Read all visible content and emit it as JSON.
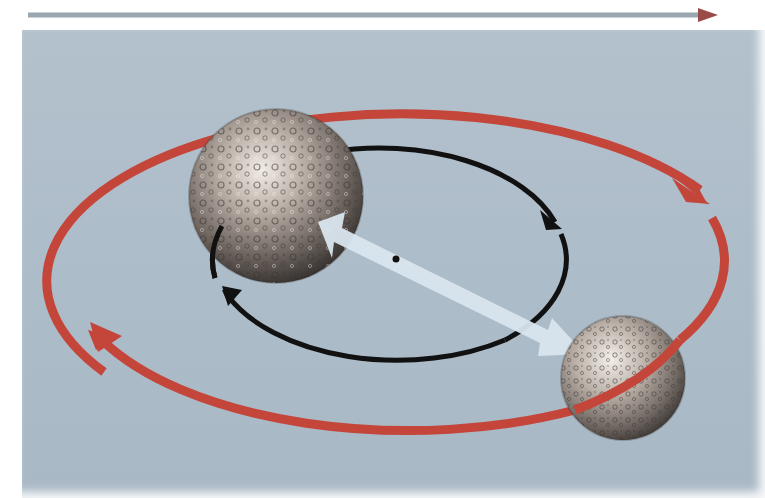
{
  "diagram": {
    "type": "binary-orbit-illustration",
    "colors": {
      "background_panel": "#adbcc8",
      "page_background": "#ffffff",
      "outer_orbit": "#c4463a",
      "inner_orbit": "#111111",
      "connector_arrow": "#d9e5ee",
      "dashed_arrow_dash": "#c0504d",
      "dashed_arrow_gap": "#9aa7b1",
      "barycenter_dot": "#111111"
    },
    "elements": {
      "top_arrow": {
        "style": "dashed",
        "direction": "right"
      },
      "outer_orbit": {
        "arrowheads": 2,
        "direction": "clockwise"
      },
      "inner_orbit": {
        "arrowheads": 2,
        "direction": "clockwise"
      },
      "large_body": {
        "label": "larger-body",
        "surface": "cratered"
      },
      "small_body": {
        "label": "smaller-body",
        "surface": "cratered"
      },
      "connector": {
        "style": "double-headed",
        "between": [
          "larger-body",
          "smaller-body"
        ]
      },
      "barycenter": {
        "marker": "dot"
      }
    }
  }
}
